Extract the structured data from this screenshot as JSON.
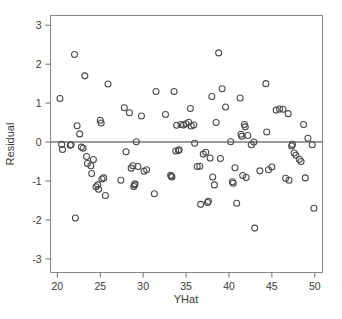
{
  "chart_data": {
    "type": "scatter",
    "title": "",
    "subtitle": "",
    "xlabel": "YHat",
    "ylabel": "Residual",
    "xlim": [
      19.2,
      50.9
    ],
    "ylim": [
      -3.35,
      3.25
    ],
    "xticks": [
      20,
      25,
      30,
      35,
      40,
      45,
      50
    ],
    "xtick_labels": [
      "20",
      "25",
      "30",
      "35",
      "40",
      "45",
      "50"
    ],
    "yticks": [
      -3,
      -2,
      -1,
      0,
      1,
      2,
      3
    ],
    "ytick_labels": [
      "-3",
      "-2",
      "-1",
      "0",
      "1",
      "2",
      "3"
    ],
    "grid": false,
    "legend": null,
    "legend_position": "none",
    "marker": "open-circle",
    "marker_color": "#4a4a4a",
    "marker_size": 6,
    "reference_lines": [
      {
        "name": "zero-residual-line",
        "orientation": "horizontal",
        "y": 0,
        "color": "#7a7a7a"
      }
    ],
    "series": [
      {
        "name": "residuals",
        "points": [
          [
            20.3,
            1.12
          ],
          [
            20.5,
            -0.06
          ],
          [
            20.6,
            -0.19
          ],
          [
            21.5,
            -0.08
          ],
          [
            21.6,
            -0.07
          ],
          [
            22.0,
            2.25
          ],
          [
            22.1,
            -1.95
          ],
          [
            22.3,
            0.42
          ],
          [
            22.6,
            0.21
          ],
          [
            22.8,
            -0.13
          ],
          [
            23.0,
            -0.16
          ],
          [
            23.2,
            1.7
          ],
          [
            23.4,
            -0.37
          ],
          [
            23.5,
            -0.55
          ],
          [
            23.9,
            -0.61
          ],
          [
            24.0,
            -0.81
          ],
          [
            24.2,
            -0.45
          ],
          [
            24.5,
            -1.15
          ],
          [
            24.7,
            -1.1
          ],
          [
            24.8,
            -1.21
          ],
          [
            25.0,
            0.56
          ],
          [
            25.1,
            0.49
          ],
          [
            25.2,
            -0.95
          ],
          [
            25.4,
            -0.92
          ],
          [
            25.6,
            -1.37
          ],
          [
            25.9,
            1.49
          ],
          [
            27.4,
            -0.98
          ],
          [
            27.8,
            0.88
          ],
          [
            28.0,
            -0.25
          ],
          [
            28.4,
            0.75
          ],
          [
            28.6,
            -0.67
          ],
          [
            28.8,
            -0.61
          ],
          [
            28.9,
            -1.14
          ],
          [
            29.0,
            -1.1
          ],
          [
            29.05,
            -1.07
          ],
          [
            29.2,
            0.01
          ],
          [
            29.4,
            -0.63
          ],
          [
            29.8,
            0.67
          ],
          [
            30.1,
            -0.75
          ],
          [
            30.4,
            -0.71
          ],
          [
            31.3,
            -1.33
          ],
          [
            31.5,
            1.3
          ],
          [
            32.6,
            0.71
          ],
          [
            33.2,
            -0.85
          ],
          [
            33.3,
            -0.88
          ],
          [
            33.35,
            -0.9
          ],
          [
            33.6,
            1.3
          ],
          [
            33.8,
            -0.23
          ],
          [
            33.9,
            0.43
          ],
          [
            34.1,
            -0.22
          ],
          [
            34.2,
            -0.2
          ],
          [
            34.4,
            0.45
          ],
          [
            34.7,
            0.44
          ],
          [
            35.0,
            0.47
          ],
          [
            35.3,
            0.51
          ],
          [
            35.5,
            0.86
          ],
          [
            35.6,
            0.41
          ],
          [
            35.9,
            0.44
          ],
          [
            36.0,
            -0.03
          ],
          [
            36.3,
            -0.63
          ],
          [
            36.6,
            -0.62
          ],
          [
            36.7,
            -1.6
          ],
          [
            37.0,
            -0.31
          ],
          [
            37.3,
            -0.26
          ],
          [
            37.5,
            -1.55
          ],
          [
            37.6,
            -1.52
          ],
          [
            37.8,
            -0.41
          ],
          [
            38.0,
            1.17
          ],
          [
            38.1,
            -0.9
          ],
          [
            38.3,
            -1.1
          ],
          [
            38.5,
            0.5
          ],
          [
            38.8,
            2.29
          ],
          [
            39.0,
            -0.42
          ],
          [
            39.2,
            1.37
          ],
          [
            39.6,
            0.9
          ],
          [
            40.2,
            0.01
          ],
          [
            40.4,
            -1.02
          ],
          [
            40.5,
            -1.06
          ],
          [
            40.7,
            -0.66
          ],
          [
            40.9,
            -1.57
          ],
          [
            41.3,
            1.13
          ],
          [
            41.4,
            0.2
          ],
          [
            41.5,
            0.15
          ],
          [
            41.6,
            -0.86
          ],
          [
            41.8,
            0.45
          ],
          [
            41.9,
            0.39
          ],
          [
            42.0,
            -0.91
          ],
          [
            42.2,
            0.17
          ],
          [
            42.6,
            -0.07
          ],
          [
            42.9,
            0.0
          ],
          [
            43.0,
            -2.21
          ],
          [
            43.6,
            -0.74
          ],
          [
            44.3,
            1.5
          ],
          [
            44.4,
            0.26
          ],
          [
            44.6,
            -0.71
          ],
          [
            45.0,
            -0.64
          ],
          [
            45.5,
            0.82
          ],
          [
            45.9,
            0.85
          ],
          [
            46.3,
            0.84
          ],
          [
            46.6,
            -0.93
          ],
          [
            46.9,
            0.73
          ],
          [
            47.0,
            -0.98
          ],
          [
            47.3,
            -0.1
          ],
          [
            47.4,
            -0.06
          ],
          [
            47.6,
            -0.28
          ],
          [
            47.8,
            -0.34
          ],
          [
            48.2,
            -0.44
          ],
          [
            48.4,
            -0.5
          ],
          [
            48.7,
            0.45
          ],
          [
            48.9,
            -0.92
          ],
          [
            49.2,
            0.1
          ],
          [
            49.7,
            -0.07
          ],
          [
            49.9,
            -1.7
          ]
        ]
      }
    ]
  },
  "figure": {
    "xlabel": "YHat",
    "ylabel": "Residual"
  }
}
